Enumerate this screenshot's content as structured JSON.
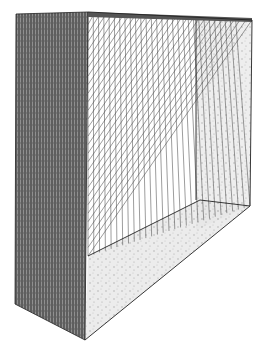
{
  "colors": {
    "background": "#ffffff",
    "ink": "#2a2a2a",
    "string": "#3a3a3a",
    "side_shade": "#6b6b6b",
    "inner_shade": "#c9c9c9"
  },
  "geometry": {
    "left_face": [
      [
        16,
        14
      ],
      [
        88,
        12
      ],
      [
        85,
        340
      ],
      [
        15,
        304
      ]
    ],
    "back_top_edge": [
      [
        88,
        12
      ],
      [
        252,
        20
      ]
    ],
    "back_right_edge": [
      [
        252,
        20
      ],
      [
        250,
        206
      ]
    ],
    "inner_back_vertical": [
      [
        196,
        20
      ],
      [
        196,
        200
      ]
    ],
    "bottom_front_edge": [
      [
        85,
        340
      ],
      [
        250,
        206
      ]
    ],
    "inner_floor_edge": [
      [
        88,
        256
      ],
      [
        200,
        200
      ]
    ],
    "string_count": 28
  }
}
